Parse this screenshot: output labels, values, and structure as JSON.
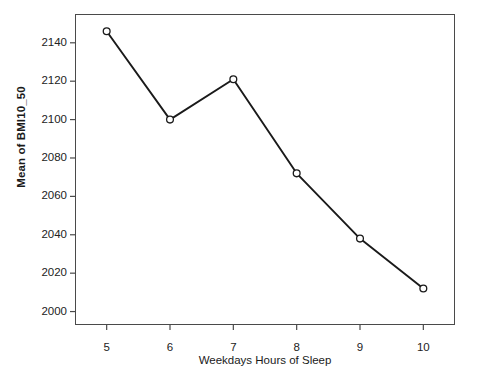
{
  "chart_data": {
    "type": "line",
    "title": "",
    "subtitle": "",
    "xlabel": "Weekdays Hours of Sleep",
    "ylabel": "Mean of BMI10_50",
    "x": [
      5,
      6,
      7,
      8,
      9,
      10
    ],
    "categories": [
      "5",
      "6",
      "7",
      "8",
      "9",
      "10"
    ],
    "values": [
      2146,
      2100,
      2121,
      2072,
      2038,
      2012
    ],
    "series": [
      {
        "name": "Mean of BMI10_50",
        "values": [
          2146,
          2100,
          2121,
          2072,
          2038,
          2012
        ]
      }
    ],
    "xlim": [
      4.5,
      10.5
    ],
    "ylim": [
      1993,
      2155
    ],
    "xticks": [
      5,
      6,
      7,
      8,
      9,
      10
    ],
    "xtick_labels": [
      "5",
      "6",
      "7",
      "8",
      "9",
      "10"
    ],
    "yticks": [
      2000,
      2020,
      2040,
      2060,
      2080,
      2100,
      2120,
      2140
    ],
    "ytick_labels": [
      "2000",
      "2020",
      "2040",
      "2060",
      "2080",
      "2100",
      "2120",
      "2140"
    ],
    "grid": false,
    "legend": false,
    "legend_position": "none",
    "marker": "open-circle",
    "line_color": "#1a1a1a",
    "marker_fill": "#ffffff",
    "marker_stroke": "#1a1a1a",
    "background_color": "#ffffff",
    "frame_color": "#4a4a4a"
  }
}
